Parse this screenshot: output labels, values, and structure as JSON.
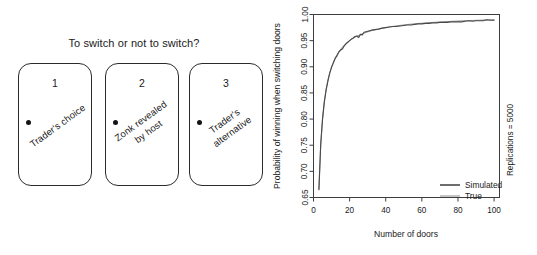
{
  "doors_panel": {
    "title": "To switch or not to switch?",
    "doors": [
      {
        "number": "1",
        "caption": "Trader's choice",
        "knob": "door-knob-dot"
      },
      {
        "number": "2",
        "caption": "Zonk revealed\nby host",
        "knob": "door-knob-dot"
      },
      {
        "number": "3",
        "caption": "Trader's\nalternative",
        "knob": "door-knob-dot"
      }
    ]
  },
  "chart_data": {
    "type": "line",
    "title": "",
    "xlabel": "Number of doors",
    "ylabel": "Probability of winning when switching doors",
    "annotation": "Replications = 5000",
    "xlim": [
      0,
      103
    ],
    "ylim": [
      0.65,
      1.0
    ],
    "xticks": [
      "0",
      "20",
      "40",
      "60",
      "80",
      "100"
    ],
    "xtick_values": [
      0,
      20,
      40,
      60,
      80,
      100
    ],
    "yticks": [
      "0.65",
      "0.70",
      "0.75",
      "0.80",
      "0.85",
      "0.90",
      "0.95",
      "1.00"
    ],
    "ytick_values": [
      0.65,
      0.7,
      0.75,
      0.8,
      0.85,
      0.9,
      0.95,
      1.0
    ],
    "grid": false,
    "legend_position": "bottom-right",
    "legend": [
      {
        "name": "Simulated",
        "style": "thick"
      },
      {
        "name": "True",
        "style": "thin"
      }
    ],
    "x": [
      3,
      4,
      5,
      6,
      7,
      8,
      9,
      10,
      11,
      12,
      13,
      14,
      15,
      16,
      17,
      18,
      19,
      20,
      21,
      22,
      23,
      24,
      25,
      26,
      27,
      28,
      29,
      30,
      32,
      34,
      36,
      38,
      40,
      42,
      44,
      46,
      48,
      50,
      52,
      54,
      56,
      58,
      60,
      62,
      64,
      66,
      68,
      70,
      72,
      74,
      76,
      78,
      80,
      82,
      84,
      86,
      88,
      90,
      92,
      94,
      96,
      98,
      100
    ],
    "series": [
      {
        "name": "Simulated",
        "values": [
          0.665,
          0.752,
          0.8,
          0.833,
          0.856,
          0.873,
          0.888,
          0.899,
          0.907,
          0.916,
          0.921,
          0.928,
          0.932,
          0.934,
          0.94,
          0.944,
          0.947,
          0.95,
          0.953,
          0.955,
          0.958,
          0.959,
          0.956,
          0.962,
          0.961,
          0.966,
          0.967,
          0.968,
          0.97,
          0.971,
          0.972,
          0.974,
          0.975,
          0.976,
          0.977,
          0.977,
          0.978,
          0.979,
          0.98,
          0.98,
          0.981,
          0.982,
          0.982,
          0.983,
          0.983,
          0.984,
          0.984,
          0.985,
          0.985,
          0.985,
          0.986,
          0.986,
          0.986,
          0.986,
          0.987,
          0.988,
          0.987,
          0.988,
          0.988,
          0.988,
          0.99,
          0.989,
          0.989
        ]
      },
      {
        "name": "True",
        "values": [
          0.6667,
          0.75,
          0.8,
          0.8333,
          0.8571,
          0.875,
          0.8889,
          0.9,
          0.9091,
          0.9167,
          0.9231,
          0.9286,
          0.9333,
          0.9375,
          0.9412,
          0.9444,
          0.9474,
          0.95,
          0.9524,
          0.9545,
          0.9565,
          0.9583,
          0.96,
          0.9615,
          0.963,
          0.9643,
          0.9655,
          0.9667,
          0.9688,
          0.9706,
          0.9722,
          0.9737,
          0.975,
          0.9762,
          0.9773,
          0.9783,
          0.9792,
          0.98,
          0.9808,
          0.9815,
          0.9821,
          0.9828,
          0.9833,
          0.9839,
          0.9844,
          0.9848,
          0.9853,
          0.9857,
          0.9861,
          0.9865,
          0.9868,
          0.9872,
          0.9875,
          0.9878,
          0.9881,
          0.9884,
          0.9886,
          0.9889,
          0.9891,
          0.9894,
          0.9896,
          0.9898,
          0.99
        ]
      }
    ]
  },
  "colors": {
    "ink": "#1a1a1a",
    "frame": "#3d3d3d",
    "series_simulated": "#4a4a4a",
    "series_true": "#6e6e6e",
    "background": "#ffffff"
  }
}
